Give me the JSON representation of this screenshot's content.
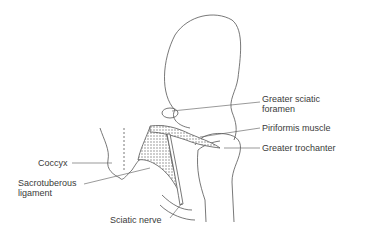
{
  "diagram": {
    "labels": {
      "greater_sciatic_foramen_line1": "Greater sciatic",
      "greater_sciatic_foramen_line2": "foramen",
      "piriformis_muscle": "Piriformis muscle",
      "greater_trochanter": "Greater trochanter",
      "coccyx": "Coccyx",
      "sacrotuberous_ligament_line1": "Sacrotuberous",
      "sacrotuberous_ligament_line2": "ligament",
      "sciatic_nerve": "Sciatic nerve"
    },
    "colors": {
      "line": "#555555",
      "text": "#3a3a3a",
      "background": "#ffffff"
    }
  }
}
